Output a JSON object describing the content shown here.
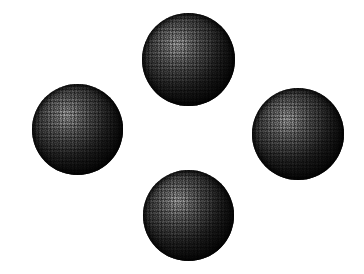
{
  "canvas": {
    "width": 364,
    "height": 274,
    "background_color": "#ffffff"
  },
  "scene": {
    "title": "Four shaded spheres in diamond arrangement",
    "render_style": "dithered-halftone-bitmap",
    "object_count": 4,
    "light_direction": "upper-left",
    "sphere_color_dark": "#050505",
    "sphere_color_mid": "#3a3a3a",
    "sphere_color_highlight": "#8e8e8e"
  },
  "spheres": [
    {
      "name": "top-sphere",
      "position": "top",
      "x": 142,
      "y": 13,
      "diameter": 93,
      "highlight_x_pct": 38,
      "highlight_y_pct": 34
    },
    {
      "name": "left-sphere",
      "position": "left",
      "x": 32,
      "y": 84,
      "diameter": 91,
      "highlight_x_pct": 38,
      "highlight_y_pct": 34
    },
    {
      "name": "right-sphere",
      "position": "right",
      "x": 252,
      "y": 88,
      "diameter": 92,
      "highlight_x_pct": 38,
      "highlight_y_pct": 34
    },
    {
      "name": "bottom-sphere",
      "position": "bottom",
      "x": 143,
      "y": 170,
      "diameter": 91,
      "highlight_x_pct": 38,
      "highlight_y_pct": 34
    }
  ]
}
